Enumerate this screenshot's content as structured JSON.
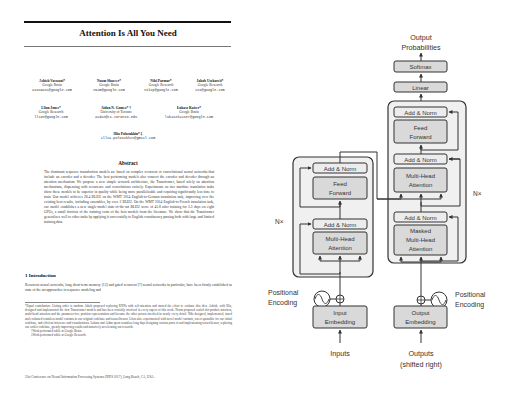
{
  "paper": {
    "title": "Attention Is All You Need",
    "authors": [
      {
        "name": "Ashish Vaswani*",
        "affiliation": "Google Brain",
        "email": "avaswani@google.com"
      },
      {
        "name": "Noam Shazeer*",
        "affiliation": "Google Brain",
        "email": "noam@google.com"
      },
      {
        "name": "Niki Parmar*",
        "affiliation": "Google Research",
        "email": "nikip@google.com"
      },
      {
        "name": "Jakob Uszkoreit*",
        "affiliation": "Google Research",
        "email": "usz@google.com"
      },
      {
        "name": "Llion Jones*",
        "affiliation": "Google Research",
        "email": "llion@google.com"
      },
      {
        "name": "Aidan N. Gomez* †",
        "affiliation": "University of Toronto",
        "email": "aidan@cs.toronto.edu"
      },
      {
        "name": "Łukasz Kaiser*",
        "affiliation": "Google Brain",
        "email": "lukaszkaiser@google.com"
      },
      {
        "name": "Illia Polosukhin* ‡",
        "affiliation": "",
        "email": "illia.polosukhin@gmail.com"
      }
    ],
    "abstract_heading": "Abstract",
    "abstract": "The dominant sequence transduction models are based on complex recurrent or convolutional neural networks that include an encoder and a decoder. The best performing models also connect the encoder and decoder through an attention mechanism. We propose a new simple network architecture, the Transformer, based solely on attention mechanisms, dispensing with recurrence and convolutions entirely. Experiments on two machine translation tasks show these models to be superior in quality while being more parallelizable and requiring significantly less time to train. Our model achieves 28.4 BLEU on the WMT 2014 English-to-German translation task, improving over the existing best results, including ensembles, by over 2 BLEU. On the WMT 2014 English-to-French translation task, our model establishes a new single-model state-of-the-art BLEU score of 41.8 after training for 3.5 days on eight GPUs, a small fraction of the training costs of the best models from the literature. We show that the Transformer generalizes well to other tasks by applying it successfully to English constituency parsing both with large and limited training data.",
    "intro_heading": "1   Introduction",
    "intro": "Recurrent neural networks, long short-term memory [13] and gated recurrent [7] neural networks in particular, have been firmly established as state of the art approaches in sequence modeling and",
    "footnote_main": "*Equal contribution. Listing order is random. Jakob proposed replacing RNNs with self-attention and started the effort to evaluate this idea. Ashish, with Illia, designed and implemented the first Transformer models and has been crucially involved in every aspect of this work. Noam proposed scaled dot-product attention, multi-head attention and the parameter-free position representation and became the other person involved in nearly every detail. Niki designed, implemented, tuned and evaluated countless model variants in our original codebase and tensor2tensor. Llion also experimented with novel model variants, was responsible for our initial codebase, and efficient inference and visualizations. Lukasz and Aidan spent countless long days designing various parts of and implementing tensor2tensor, replacing our earlier codebase, greatly improving results and massively accelerating our research.",
    "footnote_brain": "†Work performed while at Google Brain.",
    "footnote_research": "‡Work performed while at Google Research.",
    "conference": "31st Conference on Neural Information Processing Systems (NIPS 2017), Long Beach, CA, USA."
  },
  "diagram": {
    "output_probabilities": [
      "Output",
      "Probabilities"
    ],
    "softmax": "Softmax",
    "linear": "Linear",
    "add_norm": "Add & Norm",
    "feed_forward": [
      "Feed",
      "Forward"
    ],
    "multi_head_attention": [
      "Multi-Head",
      "Attention"
    ],
    "masked_multi_head_attention": [
      "Masked",
      "Multi-Head",
      "Attention"
    ],
    "nx": "N×",
    "positional_encoding": [
      "Positional",
      "Encoding"
    ],
    "input_embedding": [
      "Input",
      "Embedding"
    ],
    "output_embedding": [
      "Output",
      "Embedding"
    ],
    "inputs": "Inputs",
    "outputs": [
      "Outputs",
      "(shifted right)"
    ],
    "colors": {
      "block_bg": "#f0f0f0",
      "box_fill": "#d9d9d9",
      "addnorm_fill": "#ececec",
      "stroke": "#333333"
    }
  }
}
